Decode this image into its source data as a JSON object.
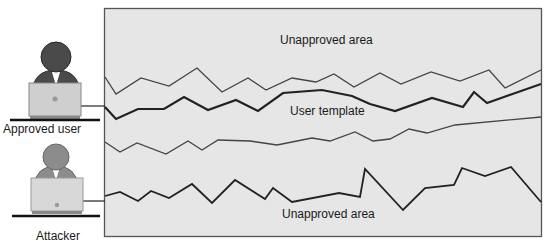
{
  "labels": {
    "top_area": "Unapproved area",
    "template": "User template",
    "bottom_area": "Unapproved area",
    "approved_user": "Approved user",
    "attacker": "Attacker"
  },
  "colors": {
    "panel_fill": "#e6e6e6",
    "frame": "#555555",
    "line": "#3a3a3a",
    "figure_approved": "#4a4a4a",
    "figure_attacker": "#8c8c8c",
    "laptop": "#c8c8c8"
  },
  "lines": {
    "upper_boundary": "105,77 116,94 141,78 169,86 197,68 222,92 248,78 266,90 292,78 316,82 334,74 354,87 380,73 401,84 431,72 460,81 489,70 505,88 541,70",
    "user_template": "105,107 116,119 138,109 164,109 184,97 208,110 236,100 258,111 283,93 322,90 352,96 370,104 395,111 432,98 463,107 474,92 487,103 541,84",
    "lower_boundary": "105,142 120,152 137,143 166,154 188,141 202,150 218,140 250,141 277,145 312,138 330,141 355,132 373,141 390,139 409,129 427,133 455,125 541,117",
    "attacker_path": "105,196 120,192 138,201 151,191 169,198 192,184 212,203 235,180 265,199 273,188 292,202 339,193 360,197 365,169 403,210 425,188 454,185 462,168 485,176 511,167 541,202"
  }
}
